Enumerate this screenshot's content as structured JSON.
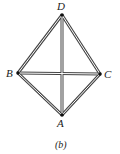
{
  "figure": {
    "caption": "(b)",
    "points": [
      {
        "name": "D",
        "x": 62,
        "y": 15
      },
      {
        "name": "B",
        "x": 18,
        "y": 73
      },
      {
        "name": "C",
        "x": 100,
        "y": 74
      },
      {
        "name": "A",
        "x": 62,
        "y": 115
      }
    ],
    "edges": [
      [
        "D",
        "B"
      ],
      [
        "D",
        "C"
      ],
      [
        "D",
        "A"
      ],
      [
        "B",
        "C"
      ],
      [
        "B",
        "A"
      ],
      [
        "C",
        "A"
      ]
    ],
    "line_color": "#333333"
  }
}
